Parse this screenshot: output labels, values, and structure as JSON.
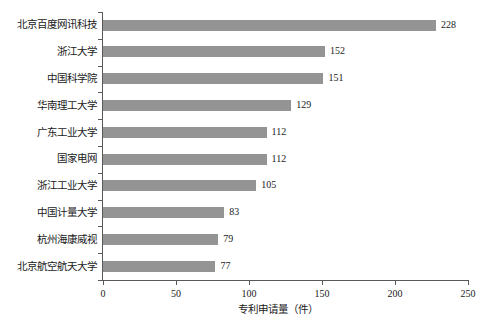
{
  "chart_data": {
    "type": "bar",
    "orientation": "horizontal",
    "title": "",
    "xlabel": "专利申请量（件）",
    "ylabel": "",
    "xlim": [
      0,
      250
    ],
    "xticks": [
      0,
      50,
      100,
      150,
      200,
      250
    ],
    "grid": false,
    "legend": null,
    "bar_color": "#949494",
    "axis_color": "#58595b",
    "categories": [
      "北京百度网讯科技",
      "浙江大学",
      "中国科学院",
      "华南理工大学",
      "广东工业大学",
      "国家电网",
      "浙江工业大学",
      "中国计量大学",
      "杭州海康威视",
      "北京航空航天大学"
    ],
    "values": [
      228,
      152,
      151,
      129,
      112,
      112,
      105,
      83,
      79,
      77
    ],
    "data_labels": [
      "228",
      "152",
      "151",
      "129",
      "112",
      "112",
      "105",
      "83",
      "79",
      "77"
    ],
    "xtick_labels": [
      "0",
      "50",
      "100",
      "150",
      "200",
      "250"
    ]
  }
}
